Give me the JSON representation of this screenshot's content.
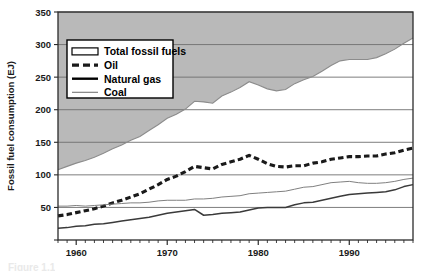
{
  "figure": {
    "caption_partial": "Figure 1.1"
  },
  "axes": {
    "y_title": "Fossil fuel consumption (EJ)",
    "y_ticks": [
      0,
      50,
      100,
      150,
      200,
      250,
      300,
      350
    ],
    "y_tick_labels": [
      "",
      "50",
      "100",
      "150",
      "200",
      "250",
      "300",
      "350"
    ],
    "x_ticks": [
      1960,
      1970,
      1980,
      1990
    ],
    "x_tick_labels": [
      "1960",
      "1970",
      "1980",
      "1990"
    ],
    "x_minor_tick_interval": 1
  },
  "legend": {
    "items": [
      {
        "label": "Total fossil fuels",
        "style": "area-swatch"
      },
      {
        "label": "Oil",
        "style": "thick-dashed"
      },
      {
        "label": "Natural gas",
        "style": "thick-solid"
      },
      {
        "label": "Coal",
        "style": "thin-solid"
      }
    ]
  },
  "colors": {
    "shaded_region": "#b9b9b9",
    "plot_background": "#ffffff",
    "total_line": "#8c8c8c",
    "oil_line": "#1a1a1a",
    "gas_line": "#3a3a3a",
    "coal_line": "#808080",
    "axis": "#2b2b2b",
    "gridline": "#6f6f6f"
  },
  "chart_data": {
    "type": "line",
    "title": "",
    "subtitle": "",
    "xlabel": "",
    "ylabel": "Fossil fuel consumption (EJ)",
    "xlim": [
      1958,
      1997
    ],
    "ylim": [
      0,
      350
    ],
    "grid": true,
    "grid_axis": "y",
    "legend_position": "upper-left-inside",
    "x": [
      1958,
      1959,
      1960,
      1961,
      1962,
      1963,
      1964,
      1965,
      1966,
      1967,
      1968,
      1969,
      1970,
      1971,
      1972,
      1973,
      1974,
      1975,
      1976,
      1977,
      1978,
      1979,
      1980,
      1981,
      1982,
      1983,
      1984,
      1985,
      1986,
      1987,
      1988,
      1989,
      1990,
      1991,
      1992,
      1993,
      1994,
      1995,
      1996,
      1997
    ],
    "series": [
      {
        "name": "Total fossil fuels",
        "style": "area-boundary",
        "values": [
          108,
          113,
          118,
          122,
          127,
          133,
          140,
          146,
          153,
          159,
          168,
          177,
          187,
          193,
          201,
          213,
          212,
          210,
          221,
          227,
          234,
          243,
          238,
          232,
          229,
          231,
          240,
          246,
          251,
          259,
          268,
          275,
          277,
          277,
          277,
          280,
          286,
          293,
          302,
          310
        ]
      },
      {
        "name": "Oil",
        "style": "thick-dashed",
        "values": [
          37,
          39,
          42,
          45,
          48,
          52,
          57,
          61,
          66,
          71,
          78,
          85,
          93,
          98,
          105,
          113,
          111,
          109,
          116,
          120,
          124,
          130,
          124,
          117,
          113,
          112,
          114,
          114,
          118,
          120,
          124,
          126,
          128,
          128,
          129,
          129,
          132,
          134,
          138,
          141
        ]
      },
      {
        "name": "Natural gas",
        "style": "thick-solid",
        "values": [
          18,
          19,
          21,
          22,
          24,
          25,
          27,
          29,
          31,
          33,
          35,
          38,
          41,
          43,
          45,
          47,
          38,
          39,
          41,
          42,
          43,
          46,
          49,
          50,
          50,
          50,
          54,
          57,
          58,
          61,
          64,
          67,
          70,
          71,
          72,
          73,
          74,
          77,
          82,
          85
        ]
      },
      {
        "name": "Coal",
        "style": "thin-solid",
        "values": [
          52,
          52,
          53,
          52,
          53,
          54,
          55,
          56,
          57,
          57,
          58,
          60,
          61,
          61,
          61,
          63,
          63,
          64,
          66,
          67,
          68,
          71,
          72,
          73,
          74,
          75,
          78,
          81,
          82,
          85,
          88,
          89,
          90,
          88,
          87,
          87,
          88,
          90,
          93,
          95
        ]
      }
    ]
  }
}
